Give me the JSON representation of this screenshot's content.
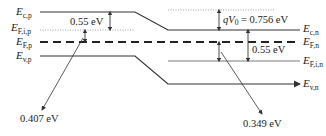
{
  "diagram": {
    "type": "pn-junction-band-diagram",
    "left_labels": {
      "Ec_p": {
        "main": "E",
        "sub": "c,p"
      },
      "EFi_p": {
        "main": "E",
        "sub": "F,i,p"
      },
      "EF_p": {
        "main": "E",
        "sub": "F,p"
      },
      "Ev_p": {
        "main": "E",
        "sub": "v,p"
      }
    },
    "right_labels": {
      "Ec_n": {
        "main": "E",
        "sub": "c,n"
      },
      "EF_n": {
        "main": "E",
        "sub": "F,n"
      },
      "EFi_n": {
        "main": "E",
        "sub": "F,i,n"
      },
      "Ev_n": {
        "main": "E",
        "sub": "v,n"
      }
    },
    "annotations": {
      "left_gap": "0.55 eV",
      "right_gap": "0.55 eV",
      "built_in_prefix": "qV",
      "built_in_sub": "0",
      "built_in_value": " = 0.756 eV",
      "left_callout": "0.407 eV",
      "right_callout": "0.349 eV"
    },
    "colors": {
      "line": "#333333",
      "dotted": "#888888",
      "text": "#222222"
    }
  }
}
